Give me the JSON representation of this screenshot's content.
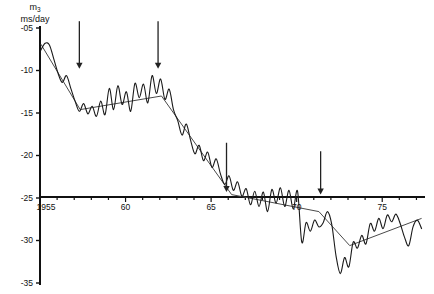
{
  "figure": {
    "title": "",
    "y_axis_label_symbol": "m",
    "y_axis_label_subscript": "3",
    "y_axis_label_units": "ms/day"
  },
  "chart_data": {
    "type": "line",
    "title": "",
    "xlabel": "",
    "ylabel": "m3 (ms/day)",
    "xlim": [
      1955,
      1977.5
    ],
    "ylim": [
      -35,
      -5
    ],
    "grid": false,
    "legend": "none",
    "y_ticks": [
      "-05",
      "-10",
      "-15",
      "-20",
      "-25",
      "-30",
      "-35"
    ],
    "y_tick_values": [
      -5,
      -10,
      -15,
      -20,
      -25,
      -30,
      -35
    ],
    "x_ticks": [
      "1955",
      "60",
      "65",
      "70",
      "75"
    ],
    "x_tick_values": [
      1955,
      1960,
      1965,
      1970,
      1975
    ],
    "x_minor_tick_step": 1,
    "annotations": [
      {
        "name": "arrow-1",
        "x": 1957.3,
        "label": "",
        "y_top": -4.2,
        "y_bottom": -9.8
      },
      {
        "name": "arrow-2",
        "x": 1961.9,
        "label": "",
        "y_top": -4.2,
        "y_bottom": -9.8
      },
      {
        "name": "arrow-3",
        "x": 1965.9,
        "label": "",
        "y_top": -18.5,
        "y_bottom": -24.3
      },
      {
        "name": "arrow-4",
        "x": 1971.4,
        "label": "",
        "y_top": -19.5,
        "y_bottom": -24.6
      }
    ],
    "series": [
      {
        "name": "m3-observed",
        "style": "jagged-line",
        "color": "#1a1a1a",
        "x": [
          1955.05,
          1955.3,
          1955.55,
          1955.8,
          1956.05,
          1956.3,
          1956.55,
          1956.8,
          1957.05,
          1957.3,
          1957.55,
          1957.8,
          1958.05,
          1958.3,
          1958.55,
          1958.8,
          1959.05,
          1959.3,
          1959.55,
          1959.8,
          1960.05,
          1960.3,
          1960.55,
          1960.8,
          1961.05,
          1961.3,
          1961.55,
          1961.8,
          1962.05,
          1962.3,
          1962.55,
          1962.8,
          1963.05,
          1963.3,
          1963.55,
          1963.8,
          1964.05,
          1964.3,
          1964.55,
          1964.8,
          1965.05,
          1965.3,
          1965.55,
          1965.8,
          1966.05,
          1966.3,
          1966.55,
          1966.8,
          1967.05,
          1967.3,
          1967.55,
          1967.8,
          1968.05,
          1968.3,
          1968.55,
          1968.8,
          1969.05,
          1969.3,
          1969.55,
          1969.8,
          1970.05,
          1970.3,
          1970.55,
          1970.8,
          1971.05,
          1971.3,
          1971.55,
          1971.8,
          1972.05,
          1972.3,
          1972.55,
          1972.8,
          1973.05,
          1973.3,
          1973.55,
          1973.8,
          1974.05,
          1974.3,
          1974.55,
          1974.8,
          1975.05,
          1975.3,
          1975.55,
          1975.8,
          1976.05,
          1976.3,
          1976.55,
          1976.8,
          1977.05,
          1977.3
        ],
        "y": [
          -7.6,
          -6.8,
          -7.0,
          -8.6,
          -10.3,
          -11.4,
          -10.6,
          -12.1,
          -13.6,
          -14.8,
          -13.9,
          -15.1,
          -14.2,
          -15.4,
          -13.6,
          -15.2,
          -12.1,
          -14.6,
          -11.8,
          -14.0,
          -12.5,
          -14.8,
          -11.5,
          -13.2,
          -11.6,
          -13.8,
          -10.6,
          -12.7,
          -11.0,
          -13.4,
          -12.2,
          -14.6,
          -15.9,
          -17.6,
          -16.3,
          -18.2,
          -19.8,
          -18.8,
          -20.6,
          -19.6,
          -21.4,
          -20.4,
          -22.2,
          -23.4,
          -22.4,
          -24.1,
          -23.1,
          -24.8,
          -23.9,
          -25.8,
          -24.2,
          -26.0,
          -24.3,
          -26.6,
          -24.0,
          -25.6,
          -23.8,
          -26.0,
          -24.1,
          -26.3,
          -24.2,
          -30.2,
          -27.9,
          -28.9,
          -27.6,
          -28.4,
          -27.9,
          -26.6,
          -28.1,
          -31.8,
          -33.9,
          -32.0,
          -33.1,
          -30.2,
          -30.9,
          -29.4,
          -30.4,
          -28.0,
          -28.9,
          -27.4,
          -28.6,
          -27.0,
          -27.8,
          -26.9,
          -28.0,
          -29.6,
          -30.6,
          -28.4,
          -27.6,
          -28.6
        ]
      },
      {
        "name": "m3-trend",
        "style": "smooth-trend",
        "color": "#4a4a4a",
        "x": [
          1955.05,
          1957.35,
          1962.1,
          1966.2,
          1971.3,
          1973.1,
          1977.3
        ],
        "y": [
          -6.9,
          -14.6,
          -13.0,
          -24.6,
          -26.6,
          -30.6,
          -27.4
        ]
      }
    ]
  }
}
